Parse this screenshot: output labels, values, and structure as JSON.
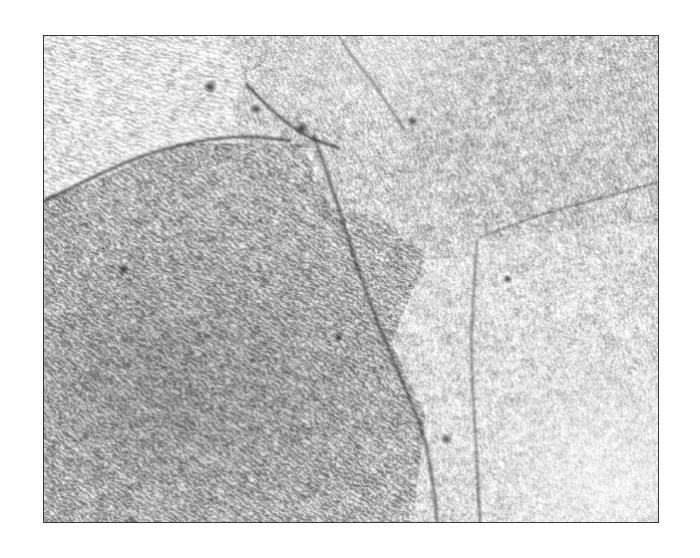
{
  "figure": {
    "kind": "tem-lattice-fringe-micrograph",
    "frame": {
      "x": 43,
      "y": 35,
      "width": 616,
      "height": 488,
      "border_color": "#3a3a3a",
      "border_width_px": 1.5
    },
    "background_color": "#ffffff",
    "tone": {
      "paper_white": "#fbfbfb",
      "fringe_dark": "#4a4a4a",
      "fringe_light": "#f5f5f5",
      "boundary_dark": "#2e2e2e"
    },
    "labels": [],
    "scale_bar": null,
    "caption": "",
    "grains": [
      {
        "id": "grain-upper-left",
        "name": "upper-left grain",
        "fringe_angle_deg": -74,
        "fringe_spacing_px": 4.6,
        "contrast": 0.46,
        "mean_gray": 0.9,
        "region": [
          [
            0,
            0
          ],
          [
            0.3,
            0
          ],
          [
            0.33,
            0.1
          ],
          [
            0.22,
            0.22
          ],
          [
            0.08,
            0.3
          ],
          [
            0,
            0.33
          ]
        ]
      },
      {
        "id": "grain-left-main",
        "name": "large left grain",
        "fringe_angle_deg": -55,
        "fringe_spacing_px": 4.8,
        "contrast": 0.58,
        "mean_gray": 0.7,
        "region": [
          [
            0,
            0.33
          ],
          [
            0.22,
            0.22
          ],
          [
            0.42,
            0.22
          ],
          [
            0.5,
            0.45
          ],
          [
            0.62,
            0.78
          ],
          [
            0.6,
            1.0
          ],
          [
            0,
            1.0
          ]
        ]
      },
      {
        "id": "grain-top-centre",
        "name": "top-centre grain",
        "fringe_angle_deg": -22,
        "fringe_spacing_px": 4.4,
        "contrast": 0.52,
        "mean_gray": 0.82,
        "region": [
          [
            0.3,
            0
          ],
          [
            0.62,
            0
          ],
          [
            0.58,
            0.18
          ],
          [
            0.42,
            0.22
          ],
          [
            0.33,
            0.1
          ]
        ]
      },
      {
        "id": "grain-right-upper",
        "name": "upper-right grain",
        "fringe_angle_deg": -12,
        "fringe_spacing_px": 4.3,
        "contrast": 0.5,
        "mean_gray": 0.8,
        "region": [
          [
            0.62,
            0
          ],
          [
            1.0,
            0
          ],
          [
            1.0,
            0.38
          ],
          [
            0.7,
            0.42
          ],
          [
            0.58,
            0.18
          ]
        ]
      },
      {
        "id": "grain-right-lower",
        "name": "lower-right grain",
        "fringe_angle_deg": -6,
        "fringe_spacing_px": 4.2,
        "contrast": 0.44,
        "mean_gray": 0.88,
        "region": [
          [
            0.7,
            0.42
          ],
          [
            1.0,
            0.38
          ],
          [
            1.0,
            1.0
          ],
          [
            0.6,
            1.0
          ],
          [
            0.62,
            0.78
          ]
        ]
      }
    ],
    "grain_boundaries": [
      {
        "id": "boundary-upper-left-arc",
        "points": [
          [
            0.0,
            0.34
          ],
          [
            0.08,
            0.29
          ],
          [
            0.16,
            0.245
          ],
          [
            0.25,
            0.215
          ],
          [
            0.33,
            0.205
          ],
          [
            0.4,
            0.215
          ]
        ],
        "darkness": 0.72,
        "width_px": 2.2
      },
      {
        "id": "boundary-top-notch",
        "points": [
          [
            0.33,
            0.1
          ],
          [
            0.36,
            0.14
          ],
          [
            0.4,
            0.185
          ],
          [
            0.44,
            0.215
          ],
          [
            0.48,
            0.23
          ]
        ],
        "darkness": 0.7,
        "width_px": 2.0
      },
      {
        "id": "boundary-top-centre-right",
        "points": [
          [
            0.48,
            0.0
          ],
          [
            0.5,
            0.04
          ],
          [
            0.53,
            0.085
          ],
          [
            0.56,
            0.14
          ],
          [
            0.585,
            0.19
          ]
        ],
        "darkness": 0.55,
        "width_px": 1.8
      },
      {
        "id": "boundary-main-diagonal",
        "points": [
          [
            0.44,
            0.21
          ],
          [
            0.47,
            0.31
          ],
          [
            0.5,
            0.44
          ],
          [
            0.54,
            0.58
          ],
          [
            0.58,
            0.7
          ],
          [
            0.62,
            0.82
          ],
          [
            0.635,
            0.93
          ],
          [
            0.64,
            1.0
          ]
        ],
        "darkness": 0.6,
        "width_px": 2.4
      },
      {
        "id": "boundary-right-vertical",
        "points": [
          [
            0.705,
            0.42
          ],
          [
            0.7,
            0.52
          ],
          [
            0.695,
            0.64
          ],
          [
            0.7,
            0.76
          ],
          [
            0.705,
            0.88
          ],
          [
            0.71,
            1.0
          ]
        ],
        "darkness": 0.48,
        "width_px": 1.8
      },
      {
        "id": "boundary-upper-right",
        "points": [
          [
            1.0,
            0.3
          ],
          [
            0.92,
            0.33
          ],
          [
            0.84,
            0.355
          ],
          [
            0.77,
            0.385
          ],
          [
            0.71,
            0.415
          ]
        ],
        "darkness": 0.4,
        "width_px": 1.6
      }
    ],
    "defects": [
      {
        "id": "dislocation-a",
        "x": 0.27,
        "y": 0.105,
        "size_px": 7
      },
      {
        "id": "dislocation-b",
        "x": 0.345,
        "y": 0.15,
        "size_px": 6
      },
      {
        "id": "dislocation-c",
        "x": 0.42,
        "y": 0.19,
        "size_px": 8
      },
      {
        "id": "dislocation-d",
        "x": 0.6,
        "y": 0.175,
        "size_px": 6
      },
      {
        "id": "dislocation-e",
        "x": 0.755,
        "y": 0.5,
        "size_px": 5
      },
      {
        "id": "dislocation-f",
        "x": 0.48,
        "y": 0.62,
        "size_px": 5
      },
      {
        "id": "dislocation-g",
        "x": 0.13,
        "y": 0.48,
        "size_px": 6
      },
      {
        "id": "dislocation-h",
        "x": 0.655,
        "y": 0.83,
        "size_px": 6
      }
    ]
  }
}
